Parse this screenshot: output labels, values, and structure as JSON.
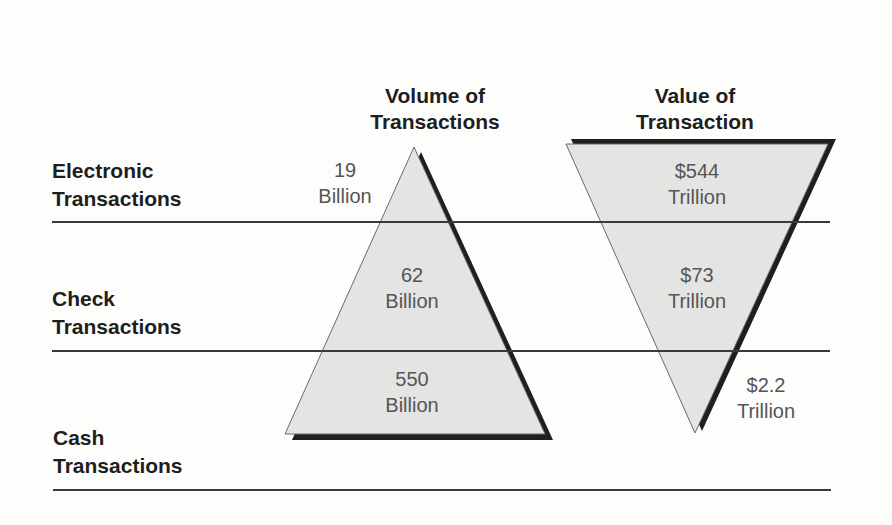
{
  "diagram": {
    "columns": [
      {
        "title_line1": "Volume of",
        "title_line2": "Transactions",
        "shape": "upright-triangle"
      },
      {
        "title_line1": "Value of",
        "title_line2": "Transaction",
        "shape": "inverted-triangle"
      }
    ],
    "rows": [
      {
        "label_line1": "Electronic",
        "label_line2": "Transactions",
        "volume_value": "19",
        "volume_unit": "Billion",
        "value_value": "$544",
        "value_unit": "Trillion"
      },
      {
        "label_line1": "Check",
        "label_line2": "Transactions",
        "volume_value": "62",
        "volume_unit": "Billion",
        "value_value": "$73",
        "value_unit": "Trillion"
      },
      {
        "label_line1": "Cash",
        "label_line2": "Transactions",
        "volume_value": "550",
        "volume_unit": "Billion",
        "value_value": "$2.2",
        "value_unit": "Trillion"
      }
    ],
    "colors": {
      "fill": "#e4e4e2",
      "outline": "#6a6a6a",
      "shadow": "#1f1f1f",
      "rule": "#3a3a3a",
      "title_text": "#1e1e1e",
      "value_text": "#555555"
    }
  }
}
